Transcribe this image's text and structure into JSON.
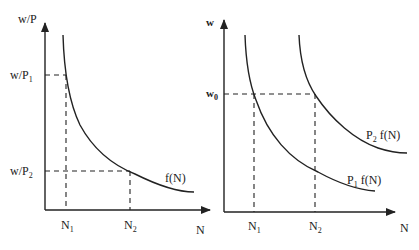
{
  "panels": [
    {
      "name": "left",
      "y_axis_label": "w/P",
      "x_axis_label": "N",
      "y_ticks": [
        {
          "base": "w/P",
          "sub": "1"
        },
        {
          "base": "w/P",
          "sub": "2"
        }
      ],
      "x_ticks": [
        {
          "base": "N",
          "sub": "1"
        },
        {
          "base": "N",
          "sub": "2"
        }
      ],
      "curve_label": "f(N)"
    },
    {
      "name": "right",
      "y_axis_label": "w",
      "x_axis_label": "N",
      "y_ticks": [
        {
          "base": "w",
          "sub": "0"
        }
      ],
      "x_ticks": [
        {
          "base": "N",
          "sub": "1"
        },
        {
          "base": "N",
          "sub": "2"
        }
      ],
      "curves": [
        {
          "pre": "P",
          "sub": "1",
          "post": " f(N)"
        },
        {
          "pre": "P",
          "sub": "2",
          "post": " f(N)"
        }
      ]
    }
  ],
  "colors": {
    "line": "#222222",
    "background": "#ffffff"
  }
}
